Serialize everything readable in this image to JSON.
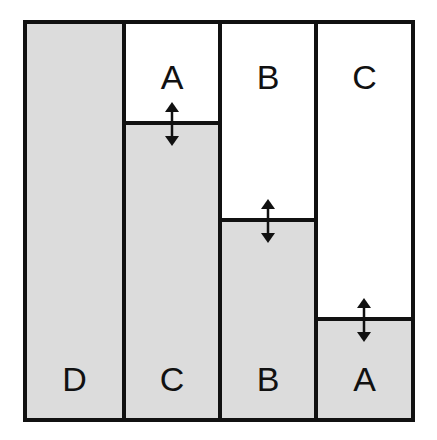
{
  "diagram": {
    "columns": [
      {
        "name": "column-1",
        "top_label": "",
        "bottom_label": "D",
        "fill_level_y": 0
      },
      {
        "name": "column-2",
        "top_label": "A",
        "bottom_label": "C",
        "fill_level_y": 97
      },
      {
        "name": "column-3",
        "top_label": "B",
        "bottom_label": "B",
        "fill_level_y": 194
      },
      {
        "name": "column-4",
        "top_label": "C",
        "bottom_label": "A",
        "fill_level_y": 293
      }
    ],
    "colors": {
      "border": "#111111",
      "fill": "#dcdcdc",
      "empty": "#ffffff"
    }
  }
}
